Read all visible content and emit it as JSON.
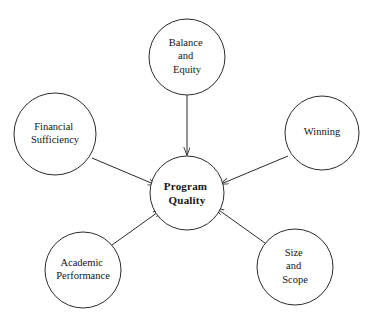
{
  "diagram": {
    "type": "hub-and-spoke-concept-map",
    "title": "Program Quality",
    "background_color": "#ffffff",
    "line_color": "#2b2b2b",
    "text_color": "#141414",
    "center_node": {
      "id": "program-quality",
      "lines": [
        "Program",
        "Quality"
      ],
      "bold": true,
      "cx": 187,
      "cy": 193,
      "r": 37
    },
    "nodes": [
      {
        "id": "balance-and-equity",
        "lines": [
          "Balance",
          "and",
          "Equity"
        ],
        "cx": 187,
        "cy": 57,
        "r": 38
      },
      {
        "id": "financial-sufficiency",
        "lines": [
          "Financial",
          "Sufficiency"
        ],
        "cx": 55,
        "cy": 134,
        "r": 41
      },
      {
        "id": "winning",
        "lines": [
          "Winning"
        ],
        "cx": 322,
        "cy": 133,
        "r": 37
      },
      {
        "id": "academic-performance",
        "lines": [
          "Academic",
          "Performance"
        ],
        "cx": 83,
        "cy": 270,
        "r": 38
      },
      {
        "id": "size-and-scope",
        "lines": [
          "Size",
          "and",
          "Scope"
        ],
        "cx": 295,
        "cy": 267,
        "r": 38
      }
    ],
    "connections": [
      {
        "id": "balance-to-center",
        "from": "balance-and-equity",
        "to": "program-quality",
        "arrow": "to-center"
      },
      {
        "id": "financial-to-center",
        "from": "financial-sufficiency",
        "to": "program-quality",
        "arrow": "to-center"
      },
      {
        "id": "winning-to-center",
        "from": "winning",
        "to": "program-quality",
        "arrow": "to-center"
      },
      {
        "id": "academic-to-center",
        "from": "academic-performance",
        "to": "program-quality",
        "arrow": "to-center"
      },
      {
        "id": "size-to-center",
        "from": "size-and-scope",
        "to": "program-quality",
        "arrow": "to-center"
      }
    ]
  }
}
